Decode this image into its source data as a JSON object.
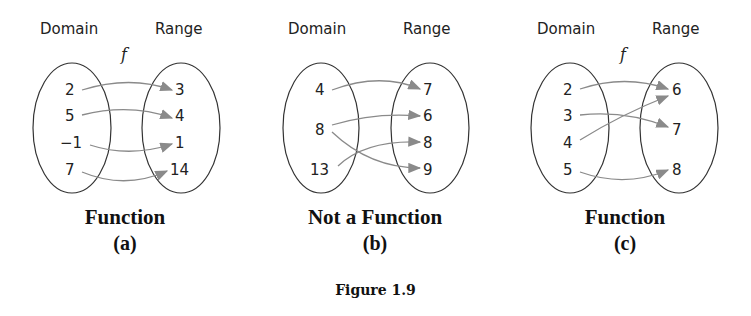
{
  "figure": {
    "caption": "Figure 1.9",
    "arrow_color": "#8a8a8a",
    "ellipse_color": "#333333",
    "panels": [
      {
        "domain_label": "Domain",
        "range_label": "Range",
        "function_name": "f",
        "domain": [
          "2",
          "5",
          "−1",
          "7"
        ],
        "range": [
          "3",
          "4",
          "1",
          "14"
        ],
        "mappings": [
          [
            "2",
            "3"
          ],
          [
            "5",
            "4"
          ],
          [
            "−1",
            "1"
          ],
          [
            "7",
            "14"
          ]
        ],
        "title": "Function",
        "sub": "(a)"
      },
      {
        "domain_label": "Domain",
        "range_label": "Range",
        "function_name": "",
        "domain": [
          "4",
          "8",
          "13"
        ],
        "range": [
          "7",
          "6",
          "8",
          "9"
        ],
        "mappings": [
          [
            "4",
            "7"
          ],
          [
            "8",
            "6"
          ],
          [
            "8",
            "9"
          ],
          [
            "13",
            "8"
          ]
        ],
        "title": "Not a Function",
        "sub": "(b)"
      },
      {
        "domain_label": "Domain",
        "range_label": "Range",
        "function_name": "f",
        "domain": [
          "2",
          "3",
          "4",
          "5"
        ],
        "range": [
          "6",
          "7",
          "8"
        ],
        "mappings": [
          [
            "2",
            "6"
          ],
          [
            "3",
            "7"
          ],
          [
            "4",
            "6"
          ],
          [
            "5",
            "8"
          ]
        ],
        "title": "Function",
        "sub": "(c)"
      }
    ]
  }
}
